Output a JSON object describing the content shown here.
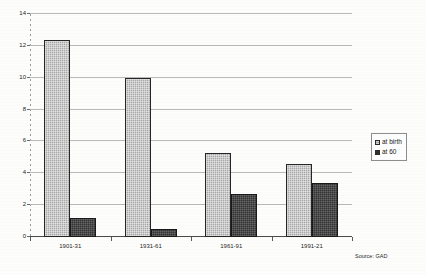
{
  "chart_data": {
    "type": "bar",
    "title": "",
    "xlabel": "",
    "ylabel": "",
    "categories": [
      "1901-31",
      "1931-61",
      "1961-91",
      "1991-21"
    ],
    "series": [
      {
        "name": "at birth",
        "values": [
          12.4,
          10.0,
          5.3,
          4.6
        ],
        "color": "#a8a8a8"
      },
      {
        "name": "at 60",
        "values": [
          1.2,
          0.5,
          2.7,
          3.4
        ],
        "color": "#333333"
      }
    ],
    "ylim": [
      0,
      14
    ],
    "yticks": [
      0,
      2,
      4,
      6,
      8,
      10,
      12,
      14
    ],
    "ytick_labels": [
      "0",
      "2",
      "4",
      "6",
      "8",
      "10",
      "12",
      "14"
    ],
    "grid": true,
    "legend_position": "right"
  },
  "legend": {
    "entries": [
      {
        "label": "at birth"
      },
      {
        "label": "at 60"
      }
    ]
  },
  "notes": {
    "source": "Source: GAD"
  }
}
